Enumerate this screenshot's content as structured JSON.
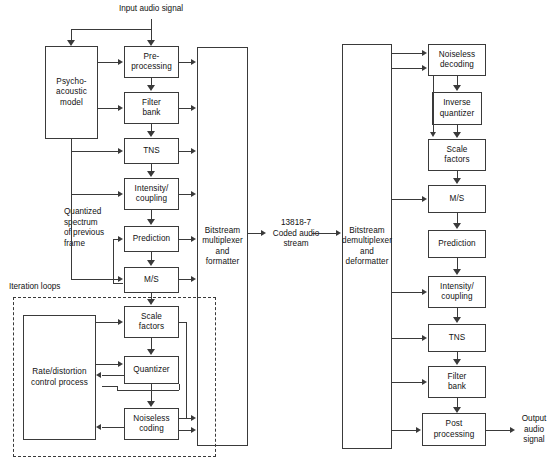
{
  "figure": {
    "line_color": "#3a3a3a",
    "background": "#ffffff"
  },
  "labels": {
    "input_audio_signal": "Input audio signal",
    "output_audio_signal": "Output\naudio\nsignal",
    "coded_stream": "13818-7\nCoded audio\nstream",
    "quantized_spectrum": "Quantized\nspectrum\nof previous\nframe",
    "iteration_loops": "Iteration loops"
  },
  "encoder": {
    "psychoacoustic_model": "Psycho-\nacoustic\nmodel",
    "pre_processing": "Pre-\nprocessing",
    "filter_bank": "Filter\nbank",
    "tns": "TNS",
    "intensity_coupling": "Intensity/\ncoupling",
    "prediction": "Prediction",
    "ms": "M/S",
    "scale_factors": "Scale\nfactors",
    "quantizer": "Quantizer",
    "noiseless_coding": "Noiseless\ncoding",
    "rate_distortion": "Rate/distortion\ncontrol process",
    "bitstream_multiplexer": "Bitstream\nmultiplexer\nand\nformatter"
  },
  "decoder": {
    "bitstream_demultiplexer": "Bitstream\ndemultiplexer\nand\ndeformatter",
    "noiseless_decoding": "Noiseless\ndecoding",
    "inverse_quantizer": "Inverse\nquantizer",
    "scale_factors": "Scale\nfactors",
    "ms": "M/S",
    "prediction": "Prediction",
    "intensity_coupling": "Intensity/\ncoupling",
    "tns": "TNS",
    "filter_bank": "Filter\nbank",
    "post_processing": "Post\nprocessing"
  }
}
